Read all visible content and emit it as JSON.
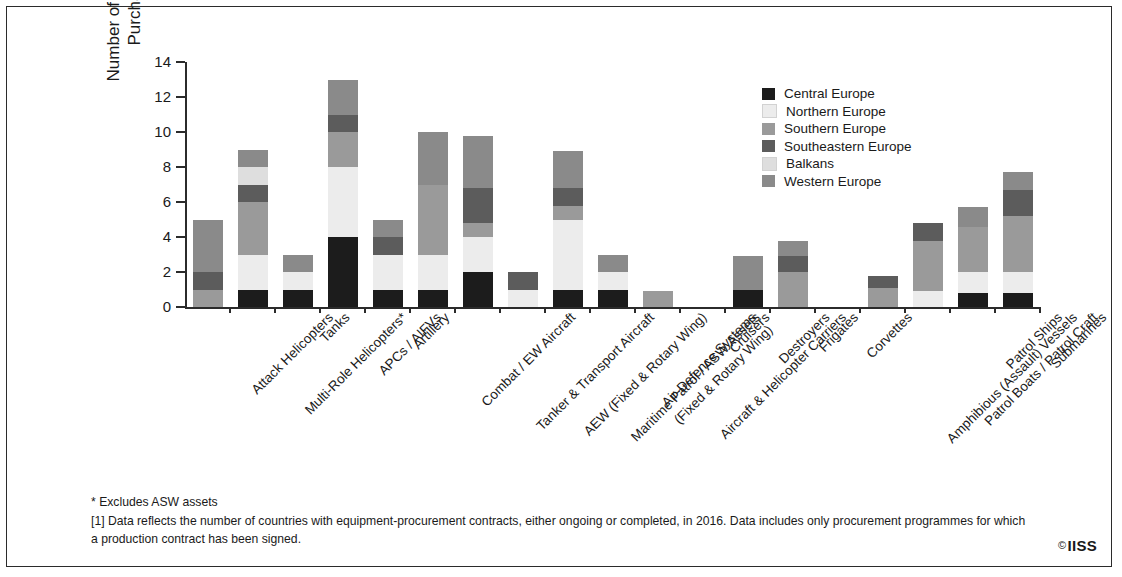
{
  "chart_data": {
    "type": "bar",
    "subtype": "stacked-vertical",
    "title": "",
    "xlabel": "",
    "ylabel": "Number of Countries\nPurchasing",
    "ylim": [
      0,
      14
    ],
    "yticks": [
      0,
      2,
      4,
      6,
      8,
      10,
      12,
      14
    ],
    "ytick_labels": [
      "0",
      "2",
      "4",
      "6",
      "8",
      "10",
      "12",
      "14"
    ],
    "grid": false,
    "legend_position": "upper-right",
    "categories": [
      "Attack Helicopters",
      "Multi-Role Helicopters*",
      "Tanks",
      "APCs / AIFVs",
      "Artillery",
      "Combat / EW Aircraft",
      "Tanker & Transport Aircraft",
      "AEW (Fixed & Rotary Wing)",
      "Maritime Patrol / ASW Assets\n(Fixed & Rotary Wing)",
      "Air-Defence Systems",
      "Aircraft & Helicopter Carriers",
      "Cruisers",
      "Destroyers",
      "Frigates",
      "Corvettes",
      "Amphibious (Assault) Vessels",
      "Patrol Boats / Patrol Craft",
      "Patrol Ships",
      "Submarines"
    ],
    "category_lines": [
      [
        "Attack Helicopters"
      ],
      [
        "Multi-Role Helicopters*"
      ],
      [
        "Tanks"
      ],
      [
        "APCs / AIFVs"
      ],
      [
        "Artillery"
      ],
      [
        "Combat / EW Aircraft"
      ],
      [
        "Tanker & Transport Aircraft"
      ],
      [
        "AEW (Fixed & Rotary Wing)"
      ],
      [
        "Maritime Patrol / ASW Assets",
        "(Fixed & Rotary Wing)"
      ],
      [
        "Air-Defence Systems"
      ],
      [
        "Aircraft & Helicopter Carriers"
      ],
      [
        "Cruisers"
      ],
      [
        "Destroyers"
      ],
      [
        "Frigates"
      ],
      [
        "Corvettes"
      ],
      [
        "Amphibious (Assault) Vessels"
      ],
      [
        "Patrol Boats / Patrol Craft"
      ],
      [
        "Patrol Ships"
      ],
      [
        "Submarines"
      ]
    ],
    "series": [
      {
        "name": "Central Europe",
        "color": "#1c1c1c",
        "values": [
          0,
          1,
          1,
          4,
          1,
          1,
          2,
          0,
          1,
          1,
          0,
          0,
          1,
          0,
          0,
          0,
          0,
          0.8,
          0.8
        ]
      },
      {
        "name": "Northern Europe",
        "color": "#ececec",
        "values": [
          0,
          2,
          1,
          4,
          2,
          2,
          2,
          1,
          4,
          1,
          0,
          0,
          0,
          0,
          0,
          0,
          0.9,
          1.2,
          1.2
        ]
      },
      {
        "name": "Southern Europe",
        "color": "#9a9a9a",
        "values": [
          1,
          3,
          0,
          2,
          0,
          4,
          0.8,
          0,
          0.8,
          0,
          0.9,
          0,
          0,
          2,
          0,
          1.1,
          2.9,
          2.6,
          3.2
        ]
      },
      {
        "name": "Southeastern Europe",
        "color": "#5c5c5c",
        "values": [
          1,
          1,
          0,
          1,
          1,
          0,
          2,
          1,
          1,
          0,
          0,
          0,
          0,
          0.9,
          0,
          0.7,
          1,
          0,
          1.5
        ]
      },
      {
        "name": "Balkans",
        "color": "#dedede",
        "values": [
          0,
          1,
          0,
          0,
          0,
          0,
          0,
          0,
          0,
          0,
          0,
          0,
          0,
          0,
          0,
          0,
          0,
          0,
          0
        ]
      },
      {
        "name": "Western Europe",
        "color": "#8a8a8a",
        "values": [
          3,
          1,
          1,
          2,
          1,
          3,
          3,
          0,
          2.1,
          1,
          0,
          0,
          1.9,
          0.9,
          0,
          0,
          0,
          1.1,
          1
        ]
      }
    ],
    "totals": [
      5,
      9,
      3,
      13,
      5,
      10,
      9.8,
      2,
      8.9,
      3,
      0.9,
      0,
      2.9,
      3.8,
      0,
      1.8,
      4.8,
      5.7,
      7.7
    ]
  },
  "legend": {
    "items": [
      {
        "label": "Central Europe",
        "color": "#1c1c1c"
      },
      {
        "label": "Northern Europe",
        "color": "#ececec"
      },
      {
        "label": "Southern Europe",
        "color": "#9a9a9a"
      },
      {
        "label": "Southeastern Europe",
        "color": "#5c5c5c"
      },
      {
        "label": "Balkans",
        "color": "#dedede"
      },
      {
        "label": "Western Europe",
        "color": "#8a8a8a"
      }
    ]
  },
  "notes": {
    "asterisk": "* Excludes ASW assets",
    "footnote": "[1] Data reflects the number of countries with equipment-procurement contracts, either ongoing or completed, in 2016. Data includes only procurement programmes for which a production contract has been signed."
  },
  "branding": {
    "copyright_mark": "©",
    "name": "IISS"
  }
}
